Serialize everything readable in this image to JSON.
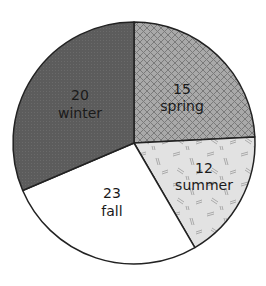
{
  "chart_data": {
    "type": "pie",
    "title": "",
    "categories": [
      "spring",
      "summer",
      "fall",
      "winter"
    ],
    "values": [
      15,
      12,
      23,
      20
    ],
    "slices": [
      {
        "label": "spring",
        "value": 15,
        "value_text": "15",
        "fill": "#a9a9a9",
        "pattern": "crosshatch",
        "start_deg": -90,
        "end_deg": -2.9,
        "label_x": 182,
        "label_y1": 94,
        "label_y2": 111
      },
      {
        "label": "summer",
        "value": 12,
        "value_text": "12",
        "fill": "#e2e2e2",
        "pattern": "dashes",
        "start_deg": -2.9,
        "end_deg": 59.8,
        "label_x": 204,
        "label_y1": 173,
        "label_y2": 190
      },
      {
        "label": "fall",
        "value": 23,
        "value_text": "23",
        "fill": "#ffffff",
        "pattern": "none",
        "start_deg": 59.8,
        "end_deg": 156.9,
        "label_x": 112,
        "label_y1": 198,
        "label_y2": 216
      },
      {
        "label": "winter",
        "value": 20,
        "value_text": "20",
        "fill": "#5c5c5c",
        "pattern": "dots",
        "start_deg": 156.9,
        "end_deg": 270,
        "label_x": 80,
        "label_y1": 100,
        "label_y2": 118
      }
    ],
    "legend": "none",
    "center": [
      134,
      143
    ],
    "radius": 121
  }
}
